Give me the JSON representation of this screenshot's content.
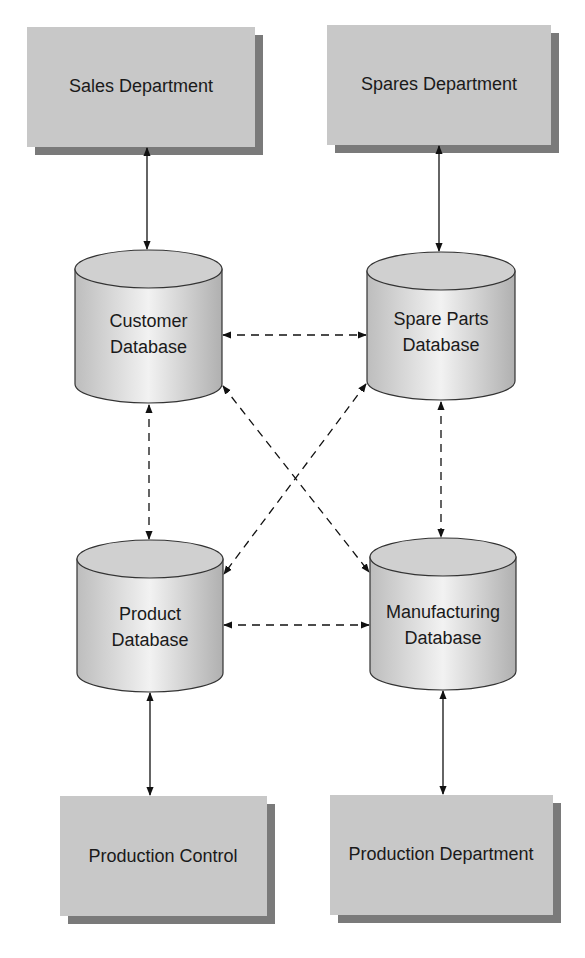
{
  "diagram": {
    "departments": [
      {
        "id": "sales",
        "label": "Sales Department"
      },
      {
        "id": "spares",
        "label": "Spares Department"
      },
      {
        "id": "production_control",
        "label": "Production Control"
      },
      {
        "id": "production_department",
        "label": "Production Department"
      }
    ],
    "databases": [
      {
        "id": "customer",
        "line1": "Customer",
        "line2": "Database"
      },
      {
        "id": "spare_parts",
        "line1": "Spare Parts",
        "line2": "Database"
      },
      {
        "id": "product",
        "line1": "Product",
        "line2": "Database"
      },
      {
        "id": "manufacturing",
        "line1": "Manufacturing",
        "line2": "Database"
      }
    ],
    "connections": [
      {
        "from": "Sales Department",
        "to": "Customer Database",
        "style": "solid",
        "direction": "both"
      },
      {
        "from": "Spares Department",
        "to": "Spare Parts Database",
        "style": "solid",
        "direction": "both"
      },
      {
        "from": "Product Database",
        "to": "Production Control",
        "style": "solid",
        "direction": "both"
      },
      {
        "from": "Manufacturing Database",
        "to": "Production Department",
        "style": "solid",
        "direction": "both"
      },
      {
        "from": "Customer Database",
        "to": "Spare Parts Database",
        "style": "dashed",
        "direction": "both"
      },
      {
        "from": "Customer Database",
        "to": "Product Database",
        "style": "dashed",
        "direction": "both"
      },
      {
        "from": "Customer Database",
        "to": "Manufacturing Database",
        "style": "dashed",
        "direction": "both"
      },
      {
        "from": "Spare Parts Database",
        "to": "Product Database",
        "style": "dashed",
        "direction": "both"
      },
      {
        "from": "Spare Parts Database",
        "to": "Manufacturing Database",
        "style": "dashed",
        "direction": "both"
      },
      {
        "from": "Product Database",
        "to": "Manufacturing Database",
        "style": "dashed",
        "direction": "both"
      }
    ],
    "colors": {
      "box_fill": "#c8c8c8",
      "box_shadow": "#7a7a7a",
      "cylinder_fill": "#d8d8d8",
      "line": "#111111"
    }
  }
}
